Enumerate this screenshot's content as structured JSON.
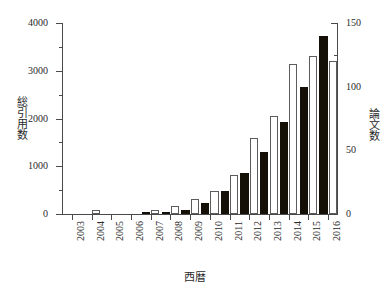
{
  "chart_data": {
    "type": "bar",
    "title": "",
    "subtitle": "",
    "xlabel": "西暦",
    "ylabel": "総引用数",
    "ylabel_right": "論文数",
    "categories": [
      "2003",
      "2004",
      "2005",
      "2006",
      "2007",
      "2008",
      "2009",
      "2010",
      "2011",
      "2012",
      "2013",
      "2014",
      "2015",
      "2016"
    ],
    "ylim": [
      0,
      4000
    ],
    "ylim_right": [
      0,
      150
    ],
    "yticks": [
      0,
      1000,
      2000,
      3000,
      4000
    ],
    "yticks_right": [
      0,
      50,
      100,
      150
    ],
    "yticks_minor": [
      500,
      1500,
      2500,
      3500
    ],
    "yticks_right_minor": [
      25,
      75,
      125
    ],
    "grid": false,
    "legend": "none",
    "series": [
      {
        "name": "総引用数",
        "axis": "left",
        "color": "#141008",
        "style": "filled-black",
        "values": [
          0,
          0,
          0,
          0,
          12,
          40,
          90,
          225,
          490,
          850,
          1295,
          1925,
          2670,
          3730
        ]
      },
      {
        "name": "論文数",
        "axis": "right",
        "color": "#ffffff",
        "style": "open-white",
        "values": [
          0,
          3,
          0,
          0,
          3,
          6,
          12,
          18,
          31,
          60,
          77,
          118,
          124,
          120
        ]
      }
    ]
  }
}
